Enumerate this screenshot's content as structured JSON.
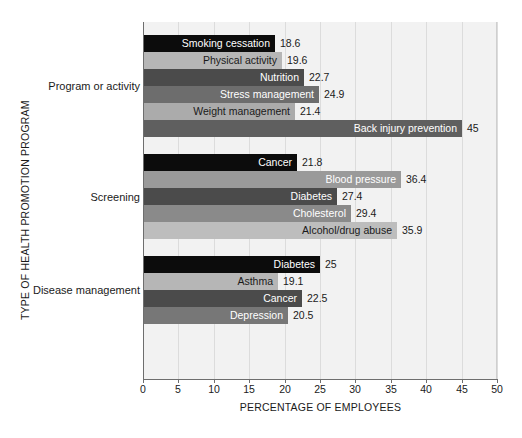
{
  "chart_data": {
    "type": "bar",
    "orientation": "horizontal",
    "title": "",
    "xlabel": "PERCENTAGE OF EMPLOYEES",
    "ylabel": "TYPE OF HEALTH PROMOTION PROGRAM",
    "xlim": [
      0,
      50
    ],
    "xticks": [
      0,
      5,
      10,
      15,
      20,
      25,
      30,
      35,
      40,
      45,
      50
    ],
    "xtick_labels": [
      "0",
      "5",
      "10",
      "15",
      "20",
      "25",
      "30",
      "35",
      "40",
      "45",
      "50"
    ],
    "grid": true,
    "legend": "none",
    "groups": [
      {
        "name": "Program or activity",
        "bars": [
          {
            "label": "Smoking cessation",
            "value": 18.6,
            "value_label": "18.6",
            "color": "#0c0c0c",
            "text_color": "#ffffff"
          },
          {
            "label": "Physical activity",
            "value": 19.6,
            "value_label": "19.6",
            "color": "#b6b6b6",
            "text_color": "#1a1a1a"
          },
          {
            "label": "Nutrition",
            "value": 22.7,
            "value_label": "22.7",
            "color": "#4b4b4b",
            "text_color": "#ffffff"
          },
          {
            "label": "Stress management",
            "value": 24.9,
            "value_label": "24.9",
            "color": "#6d6d6d",
            "text_color": "#ffffff"
          },
          {
            "label": "Weight management",
            "value": 21.4,
            "value_label": "21.4",
            "color": "#ababab",
            "text_color": "#1a1a1a"
          },
          {
            "label": "Back injury prevention",
            "value": 45.0,
            "value_label": "45",
            "color": "#5f5f5f",
            "text_color": "#ffffff"
          }
        ]
      },
      {
        "name": "Screening",
        "bars": [
          {
            "label": "Cancer",
            "value": 21.8,
            "value_label": "21.8",
            "color": "#0c0c0c",
            "text_color": "#ffffff"
          },
          {
            "label": "Blood pressure",
            "value": 36.4,
            "value_label": "36.4",
            "color": "#9a9a9a",
            "text_color": "#ffffff"
          },
          {
            "label": "Diabetes",
            "value": 27.4,
            "value_label": "27.4",
            "color": "#4b4b4b",
            "text_color": "#ffffff"
          },
          {
            "label": "Cholesterol",
            "value": 29.4,
            "value_label": "29.4",
            "color": "#8a8a8a",
            "text_color": "#ffffff"
          },
          {
            "label": "Alcohol/drug abuse",
            "value": 35.9,
            "value_label": "35.9",
            "color": "#bdbdbd",
            "text_color": "#1a1a1a"
          }
        ]
      },
      {
        "name": "Disease management",
        "bars": [
          {
            "label": "Diabetes",
            "value": 25.0,
            "value_label": "25",
            "color": "#0c0c0c",
            "text_color": "#ffffff"
          },
          {
            "label": "Asthma",
            "value": 19.1,
            "value_label": "19.1",
            "color": "#b6b6b6",
            "text_color": "#1a1a1a"
          },
          {
            "label": "Cancer",
            "value": 22.5,
            "value_label": "22.5",
            "color": "#4b4b4b",
            "text_color": "#ffffff"
          },
          {
            "label": "Depression",
            "value": 20.5,
            "value_label": "20.5",
            "color": "#777777",
            "text_color": "#ffffff"
          }
        ]
      }
    ]
  },
  "colors": {
    "plot_background": "#f2f2f2",
    "gridline": "#dcdcdc",
    "axis_line": "#6e6e6e",
    "page_background": "#ffffff",
    "text": "#1a1a1a"
  }
}
